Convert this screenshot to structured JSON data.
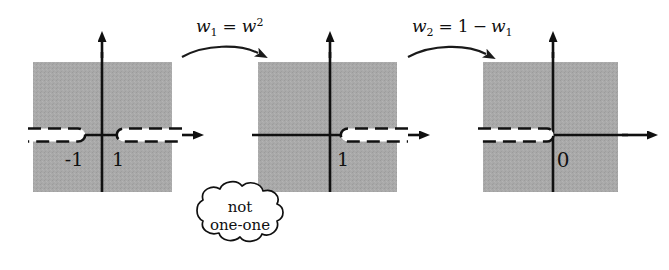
{
  "figure": {
    "type": "complex-plane-mapping-diagram",
    "panel_count": 3,
    "colors": {
      "shaded_region": "#a8a8a8",
      "axis": "#101010",
      "cut_fill": "#ffffff",
      "cut_border": "#101010",
      "background": "#ffffff",
      "text": "#101010"
    }
  },
  "panels": [
    {
      "id": "panel-w",
      "axis_labels": [
        "-1",
        "1"
      ],
      "branch_points": [
        -1,
        1
      ],
      "cuts": [
        {
          "name": "left-cut",
          "direction": "left",
          "from": -1
        },
        {
          "name": "right-cut",
          "direction": "right",
          "from": 1
        }
      ]
    },
    {
      "id": "panel-w1",
      "axis_labels": [
        "1"
      ],
      "branch_points": [
        1
      ],
      "cuts": [
        {
          "name": "right-cut",
          "direction": "right",
          "from": 1
        }
      ]
    },
    {
      "id": "panel-w2",
      "axis_labels": [
        "0"
      ],
      "branch_points": [
        0
      ],
      "cuts": [
        {
          "name": "left-cut",
          "direction": "left",
          "from": 0
        }
      ]
    }
  ],
  "arrows": [
    {
      "id": "arrow-1",
      "formula_parts": {
        "lhs": "w",
        "lhs_sub": "1",
        "eq": "=",
        "rhs": "w",
        "rhs_sup": "2"
      },
      "formula_text": "w1 = w2"
    },
    {
      "id": "arrow-2",
      "formula_parts": {
        "lhs": "w",
        "lhs_sub": "2",
        "eq": "=",
        "rhs_const": "1",
        "minus": "−",
        "rhs": "w",
        "rhs_sub": "1"
      },
      "formula_text": "w2 = 1 - w1"
    }
  ],
  "callout": {
    "id": "cloud-callout",
    "line1": "not",
    "line2": "one-one"
  }
}
